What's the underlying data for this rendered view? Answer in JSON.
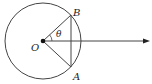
{
  "diagram": {
    "type": "geometry",
    "labels": {
      "center": "O",
      "point_b": "B",
      "point_a": "A",
      "angle": "θ"
    },
    "colors": {
      "stroke": "#333333",
      "background": "#ffffff"
    },
    "geometry": {
      "center": [
        43,
        41
      ],
      "radius": 38,
      "point_b": [
        71,
        15
      ],
      "point_a": [
        71,
        67
      ],
      "ray_end": [
        150,
        41
      ]
    }
  }
}
